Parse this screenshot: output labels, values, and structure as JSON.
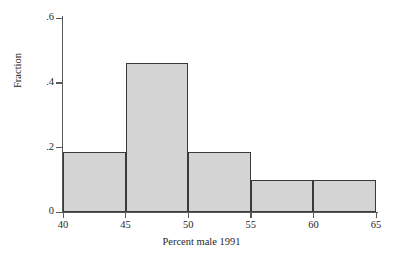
{
  "chart_data": {
    "type": "bar",
    "title": "",
    "subtitle": "",
    "xlabel": "Percent male 1991",
    "ylabel": "Fraction",
    "categories": [
      "40-45",
      "45-50",
      "50-55",
      "55-60",
      "60-65"
    ],
    "bin_edges": [
      40,
      45,
      50,
      55,
      60,
      65
    ],
    "values": [
      0.185,
      0.46,
      0.185,
      0.1,
      0.1
    ],
    "series": [
      {
        "name": "Fraction",
        "values": [
          0.185,
          0.46,
          0.185,
          0.1,
          0.1
        ]
      }
    ],
    "xlim": [
      40,
      65
    ],
    "ylim": [
      0,
      0.6
    ],
    "x_ticks": [
      40,
      45,
      50,
      55,
      60,
      65
    ],
    "x_tick_labels": [
      "40",
      "45",
      "50",
      "55",
      "60",
      "65"
    ],
    "y_ticks": [
      0,
      0.2,
      0.4,
      0.6
    ],
    "y_tick_labels": [
      "0",
      ".2",
      ".4",
      ".6"
    ],
    "grid": false,
    "legend": false,
    "legend_position": "none",
    "bar_fill_color": "#d4d4d4",
    "bar_edge_color": "#3a3a3a",
    "axis_color": "#5a5a5a",
    "background_color": "#ffffff",
    "annotations": []
  }
}
